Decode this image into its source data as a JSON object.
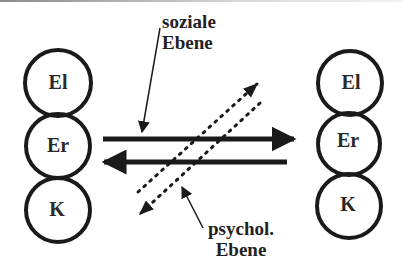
{
  "diagram": {
    "left_stack": {
      "circles": [
        {
          "label": "El"
        },
        {
          "label": "Er"
        },
        {
          "label": "K"
        }
      ]
    },
    "right_stack": {
      "circles": [
        {
          "label": "El"
        },
        {
          "label": "Er"
        },
        {
          "label": "K"
        }
      ]
    },
    "labels": {
      "social": {
        "line1": "soziale",
        "line2": "Ebene"
      },
      "psych": {
        "line1": "psychol.",
        "line2": "Ebene"
      }
    },
    "arrows": {
      "solid_right": "left-to-right solid arrow (soziale Ebene)",
      "solid_left": "right-to-left solid arrow (soziale Ebene)",
      "dotted_up": "dotted diagonal arrow up-right (psychol. Ebene)",
      "dotted_down": "dotted diagonal arrow down-left (psychol. Ebene)"
    },
    "colors": {
      "stroke": "#1a1a1a",
      "background": "#ffffff"
    }
  }
}
